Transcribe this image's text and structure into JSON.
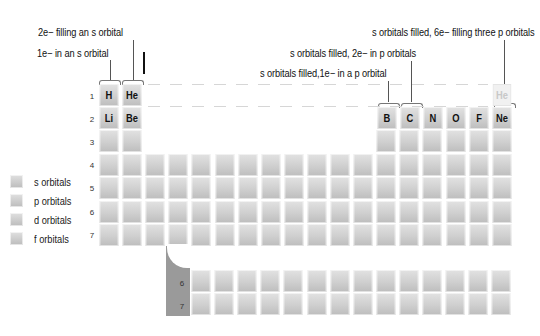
{
  "annotations": {
    "h_label": "1e− in an s orbital",
    "he_label": "2e− filling an s orbital",
    "b_label": "s orbitals filled,1e− in a p orbital",
    "c_label": "s orbitals filled, 2e− in p orbitals",
    "ne_label": "s orbitals filled, 6e− filling three p orbitals"
  },
  "elements": {
    "H": "H",
    "He": "He",
    "Li": "Li",
    "Be": "Be",
    "B": "B",
    "C": "C",
    "N": "N",
    "O": "O",
    "F": "F",
    "Ne": "Ne",
    "He_ghost": "He"
  },
  "period_numbers": [
    "1",
    "2",
    "3",
    "4",
    "5",
    "6",
    "7"
  ],
  "f_block_period_numbers": [
    "6",
    "7"
  ],
  "legend": [
    {
      "label": "s orbitals"
    },
    {
      "label": "p orbitals"
    },
    {
      "label": "d orbitals"
    },
    {
      "label": "f orbitals"
    }
  ],
  "colors": {
    "cell": "#cfcfcf",
    "ghost_cell": "#f1f1f1",
    "f_bracket": "#9a9a9a",
    "dash_line": "#d6d6d6"
  }
}
